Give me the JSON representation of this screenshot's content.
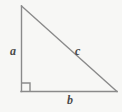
{
  "figure": {
    "kind": "right-triangle-diagram",
    "background_color": "#f7f7f5",
    "stroke_color": "#8a8a8a",
    "label_color": "#4a4a4a",
    "width": 122,
    "height": 112,
    "vertices": {
      "apex": [
        21,
        6
      ],
      "right_angle": [
        21,
        91
      ],
      "base_right": [
        117,
        91
      ]
    },
    "right_angle_marker": {
      "name": "right-angle-square",
      "origin": [
        21,
        91
      ],
      "size": 8
    },
    "labels": {
      "leg_vertical": "a",
      "hypotenuse": "c",
      "leg_horizontal": "b"
    }
  }
}
